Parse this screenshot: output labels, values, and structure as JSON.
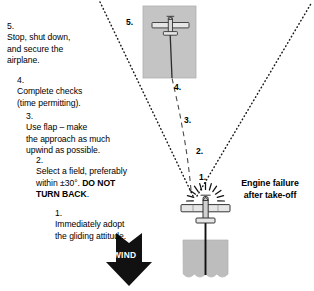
{
  "diagram": {
    "title_callout": {
      "line1": "Engine failure",
      "line2": "after take-off"
    },
    "wind": {
      "label": "WIND"
    },
    "steps": [
      {
        "number": "5.",
        "text": "Stop, shut down,\nand secure the\nairplane."
      },
      {
        "number": "4.",
        "text": "Complete checks\n(time permitting)."
      },
      {
        "number": "3.",
        "text": "Use flap – make\nthe approach as much\nupwind as possible."
      },
      {
        "number": "2.",
        "text_pre": "Select a field, preferably\nwithin ±30°. ",
        "text_bold": "DO NOT\nTURN BACK",
        "text_post": "."
      },
      {
        "number": "1.",
        "text": "Immediately adopt\nthe gliding attitude."
      }
    ],
    "path_markers": [
      {
        "label": "1."
      },
      {
        "label": "2."
      },
      {
        "label": "3."
      },
      {
        "label": "4."
      },
      {
        "label": "5."
      }
    ],
    "colors": {
      "field_fill": "#c4c4c4",
      "field_stroke": "#aeaeae",
      "runway_fill": "#bdbdbd",
      "line": "#1a1a1a",
      "text": "#000000",
      "wind_arrow": "#111111",
      "plane_body": "#d8d8d8",
      "plane_stroke": "#2b2b2b"
    }
  }
}
